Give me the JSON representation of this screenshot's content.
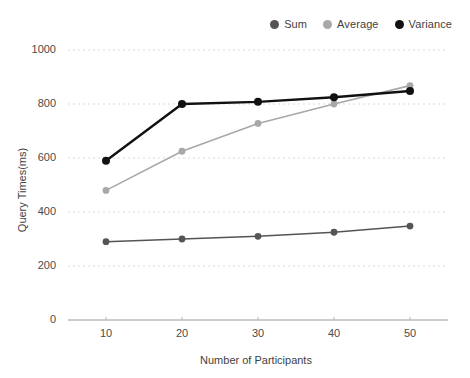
{
  "chart_data": {
    "type": "line",
    "title": "",
    "xlabel": "Number of Participants",
    "ylabel": "Query Times(ms)",
    "x": [
      10,
      20,
      30,
      40,
      50
    ],
    "xtick_labels": [
      "10",
      "20",
      "30",
      "40",
      "50"
    ],
    "ytick_labels": [
      "0",
      "200",
      "400",
      "600",
      "800",
      "1000"
    ],
    "yticks": [
      0,
      200,
      400,
      600,
      800,
      1000
    ],
    "xlim": [
      5,
      55
    ],
    "ylim": [
      0,
      1000
    ],
    "grid": "horizontal-dotted",
    "legend_position": "top-right",
    "series": [
      {
        "name": "Sum",
        "color": "#555555",
        "values": [
          290,
          300,
          310,
          325,
          348
        ]
      },
      {
        "name": "Average",
        "color": "#a8a8a8",
        "values": [
          480,
          625,
          728,
          800,
          868
        ]
      },
      {
        "name": "Variance",
        "color": "#111111",
        "values": [
          590,
          800,
          808,
          825,
          848
        ]
      }
    ]
  },
  "legend": {
    "items": [
      {
        "label": "Sum",
        "color": "#555555"
      },
      {
        "label": "Average",
        "color": "#a8a8a8"
      },
      {
        "label": "Variance",
        "color": "#111111"
      }
    ]
  },
  "axes": {
    "x_title": "Number of Participants",
    "y_title": "Query Times(ms)"
  }
}
